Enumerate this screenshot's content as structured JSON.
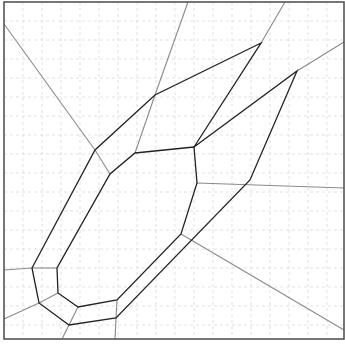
{
  "diagram": {
    "type": "polygon-offset-with-voronoi-edges",
    "frame": {
      "x1": 4,
      "y1": 2,
      "x2": 344,
      "y2": 339,
      "color": "#555555"
    },
    "grid": {
      "spacing": 19,
      "color": "#d9d9d9",
      "style": "dashed"
    },
    "colors": {
      "polygon": "#222222",
      "edges": "#8a8a8a"
    },
    "outer_polygon": [
      [
        261,
        43
      ],
      [
        155,
        95
      ],
      [
        95,
        150
      ],
      [
        32,
        268
      ],
      [
        39,
        303
      ],
      [
        69,
        325
      ],
      [
        116,
        318
      ],
      [
        250,
        180
      ],
      [
        297,
        71
      ],
      [
        194,
        147
      ]
    ],
    "inner_polygon": [
      [
        194,
        147
      ],
      [
        135,
        153
      ],
      [
        110,
        174
      ],
      [
        57,
        268
      ],
      [
        58,
        293
      ],
      [
        78,
        307
      ],
      [
        117,
        300
      ],
      [
        181,
        234
      ],
      [
        197,
        183
      ]
    ],
    "edges": [
      [
        [
          4,
          24
        ],
        [
          95,
          150
        ]
      ],
      [
        [
          95,
          150
        ],
        [
          110,
          174
        ]
      ],
      [
        [
          188,
          2
        ],
        [
          155,
          95
        ]
      ],
      [
        [
          155,
          95
        ],
        [
          135,
          153
        ]
      ],
      [
        [
          285,
          2
        ],
        [
          261,
          43
        ]
      ],
      [
        [
          297,
          71
        ],
        [
          344,
          42
        ]
      ],
      [
        [
          197,
          183
        ],
        [
          344,
          188
        ]
      ],
      [
        [
          181,
          234
        ],
        [
          344,
          330
        ]
      ],
      [
        [
          4,
          270
        ],
        [
          32,
          268
        ]
      ],
      [
        [
          32,
          268
        ],
        [
          57,
          268
        ]
      ],
      [
        [
          4,
          319
        ],
        [
          39,
          303
        ]
      ],
      [
        [
          39,
          303
        ],
        [
          58,
          293
        ]
      ],
      [
        [
          69,
          325
        ],
        [
          78,
          307
        ]
      ],
      [
        [
          69,
          325
        ],
        [
          62,
          339
        ]
      ],
      [
        [
          116,
          318
        ],
        [
          117,
          300
        ]
      ],
      [
        [
          116,
          318
        ],
        [
          115,
          339
        ]
      ]
    ]
  }
}
